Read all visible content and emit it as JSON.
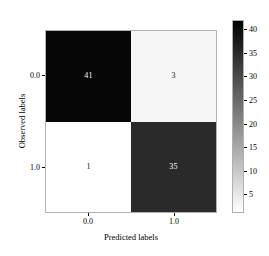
{
  "chart_data": {
    "type": "heatmap",
    "title": "",
    "xlabel": "Predicted labels",
    "ylabel": "Observed labels",
    "x_categories": [
      "0.0",
      "1.0"
    ],
    "y_categories": [
      "0.0",
      "1.0"
    ],
    "matrix": [
      [
        41,
        3
      ],
      [
        1,
        35
      ]
    ],
    "cells": [
      {
        "row": 0,
        "col": 0,
        "value": "41",
        "fill": "#060606",
        "text_color": "#ffffff"
      },
      {
        "row": 0,
        "col": 1,
        "value": "3",
        "fill": "#f5f5f5",
        "text_color": "#1a1a1a"
      },
      {
        "row": 1,
        "col": 0,
        "value": "1",
        "fill": "#ffffff",
        "text_color": "#1a1a1a"
      },
      {
        "row": 1,
        "col": 1,
        "value": "35",
        "fill": "#2a2a2a",
        "text_color": "#ffffff"
      }
    ],
    "colormap": "gray_r",
    "colorbar": {
      "vmin": 1,
      "vmax": 42,
      "tick_values": [
        40,
        35,
        30,
        25,
        20,
        15,
        10,
        5
      ],
      "tick_labels": [
        "40",
        "35",
        "30",
        "25",
        "20",
        "15",
        "10",
        "5"
      ],
      "position": "right",
      "low_color": "#ffffff",
      "high_color": "#000000"
    },
    "grid": false,
    "legend": null
  }
}
